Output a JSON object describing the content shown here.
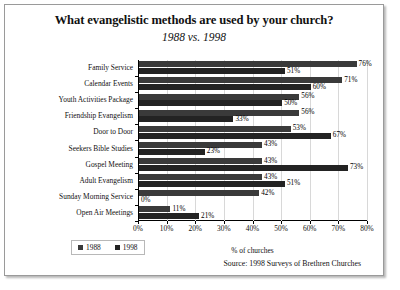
{
  "chart_data": {
    "type": "bar",
    "orientation": "horizontal",
    "title": "What evangelistic methods are used by your church?",
    "subtitle": "1988 vs. 1998",
    "xlabel": "% of churches",
    "ylabel": "",
    "xlim": [
      0,
      80
    ],
    "xticks": [
      "0%",
      "10%",
      "20%",
      "30%",
      "40%",
      "50%",
      "60%",
      "70%",
      "80%"
    ],
    "xtick_values": [
      0,
      10,
      20,
      30,
      40,
      50,
      60,
      70,
      80
    ],
    "grid": true,
    "legend_position": "bottom-left",
    "categories": [
      "Family Service",
      "Calendar Events",
      "Youth Activities Package",
      "Friendship Evangelism",
      "Door to Door",
      "Seekers Bible Studies",
      "Gospel Meeting",
      "Adult Evangelism",
      "Sunday Morning Service",
      "Open Air Meetings"
    ],
    "series": [
      {
        "name": "1988",
        "color": "#3a3a3a",
        "values": [
          76,
          71,
          56,
          56,
          53,
          43,
          43,
          43,
          42,
          11
        ],
        "labels": [
          "76%",
          "71%",
          "56%",
          "56%",
          "53%",
          "43%",
          "43%",
          "43%",
          "42%",
          "11%"
        ]
      },
      {
        "name": "1998",
        "color": "#232323",
        "values": [
          51,
          60,
          50,
          33,
          67,
          23,
          73,
          51,
          0,
          21
        ],
        "labels": [
          "51%",
          "60%",
          "50%",
          "33%",
          "67%",
          "23%",
          "73%",
          "51%",
          "0%",
          "21%"
        ]
      }
    ],
    "source": "Source: 1998 Surveys of Brethren Churches"
  }
}
